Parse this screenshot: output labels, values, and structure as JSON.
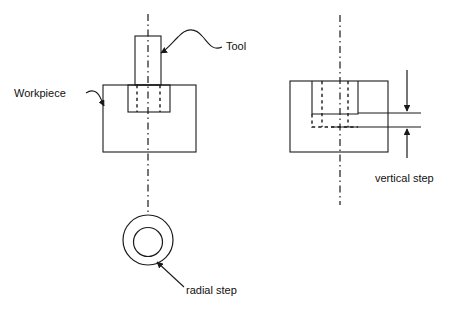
{
  "figure": {
    "background_color": "#ffffff",
    "line_color": "#1a1a1a",
    "text_color": "#111111"
  },
  "labels": {
    "tool": "Tool",
    "workpiece": "Workpiece",
    "radial_step": "radial step",
    "vertical_step": "vertical step"
  },
  "views": {
    "left": {
      "name": "front-view-with-tool",
      "workpiece_rect": {
        "x": 103,
        "y": 85,
        "width": 93,
        "height": 67
      },
      "tool_shank_rect": {
        "x": 135,
        "y": 36,
        "width": 26,
        "height": 49
      },
      "tool_pocket_rect": {
        "x": 128,
        "y": 85,
        "width": 42,
        "height": 27
      },
      "hidden_edges_x": [
        137,
        160
      ],
      "centerline_x": 148,
      "centerline_y1": 14,
      "centerline_y2": 215,
      "top_view_outer_circle": {
        "cx": 148,
        "cy": 240,
        "r": 25
      },
      "top_view_inner_circle": {
        "cx": 148,
        "cy": 242,
        "r": 14.5
      }
    },
    "right": {
      "name": "front-view-vertical-step",
      "workpiece_rect": {
        "x": 290,
        "y": 81,
        "width": 98,
        "height": 71
      },
      "tool_pocket_rect": {
        "x": 312,
        "y": 81,
        "width": 46,
        "height": 33
      },
      "hidden_pocket_rect": {
        "x": 312,
        "y": 114,
        "width": 46,
        "height": 13
      },
      "hidden_edges_x": [
        322,
        348
      ],
      "centerline_x": 340,
      "centerline_y1": 15,
      "centerline_y2": 205,
      "dim_line_upper_y": 113,
      "dim_line_lower_y": 127,
      "dim_line_x1": 358,
      "dim_line_x2": 421,
      "dim_arrow_x": 407,
      "dim_arrow_top_y": 70,
      "dim_arrow_bottom_y": 158
    }
  },
  "leaders": {
    "tool": {
      "text_anchor": {
        "x": 224,
        "y": 48
      },
      "arrow_tip": {
        "x": 160,
        "y": 54
      }
    },
    "workpiece": {
      "text_anchor": {
        "x": 87,
        "y": 92
      },
      "arrow_tip": {
        "x": 105,
        "y": 107
      }
    },
    "radial_step": {
      "text_anchor": {
        "x": 183,
        "y": 286
      },
      "arrow_tip": {
        "x": 156,
        "y": 261
      }
    }
  }
}
